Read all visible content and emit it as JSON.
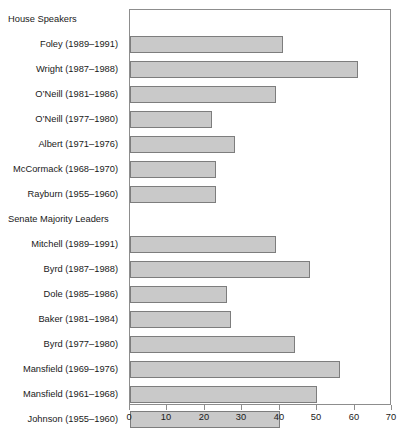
{
  "chart_data": {
    "type": "bar",
    "orientation": "horizontal",
    "title": "",
    "xlabel": "",
    "ylabel": "",
    "xlim": [
      0,
      70
    ],
    "xticks": [
      0,
      10,
      20,
      30,
      40,
      50,
      60,
      70
    ],
    "grid": false,
    "legend": null,
    "groups": [
      {
        "name": "House Speakers",
        "categories": [
          "Foley (1989–1991)",
          "Wright (1987–1988)",
          "O’Neill (1981–1986)",
          "O’Neill (1977–1980)",
          "Albert (1971–1976)",
          "McCormack (1968–1970)",
          "Rayburn (1955–1960)"
        ],
        "values": [
          41,
          61,
          39,
          22,
          28,
          23,
          23
        ]
      },
      {
        "name": "Senate Majority Leaders",
        "categories": [
          "Mitchell (1989–1991)",
          "Byrd (1987–1988)",
          "Dole (1985–1986)",
          "Baker (1981–1984)",
          "Byrd (1977–1980)",
          "Mansfield (1969–1976)",
          "Mansfield (1961–1968)",
          "Johnson (1955–1960)"
        ],
        "values": [
          39,
          48,
          26,
          27,
          44,
          56,
          50,
          40
        ]
      }
    ],
    "colors": {
      "bar_fill": "#c9c9c9",
      "bar_border": "#7d7d7d",
      "axis": "#8d8d8d",
      "text": "#1a1a1a",
      "background": "#ffffff"
    }
  }
}
